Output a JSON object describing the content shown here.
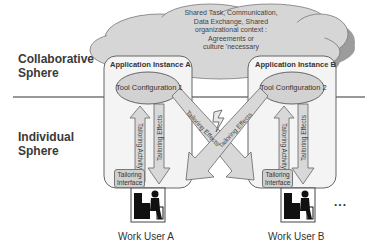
{
  "spheres": {
    "collaborative": {
      "line1": "Collaborative",
      "line2": "Sphere"
    },
    "individual": {
      "line1": "Individual",
      "line2": "Sphere"
    }
  },
  "cloud": {
    "lines": [
      "Shared Task, Communication,",
      "Data Exchange, Shared",
      "organizational context :",
      "Agreements or",
      "culture 'necessary"
    ]
  },
  "instances": [
    {
      "title": "Application Instance A",
      "tool_config": "Tool Configuration 1",
      "activity_label": "Tailoring Activity",
      "effects_label": "Tailoring Effects",
      "interface": {
        "line1": "Tailoring",
        "line2": "Interface"
      },
      "user": "Work User A"
    },
    {
      "title": "Application Instance B",
      "tool_config": "Tool Configuration 2",
      "activity_label": "Tailoring Activity",
      "effects_label": "Tailoring Effects",
      "interface": {
        "line1": "Tailoring",
        "line2": "Interface"
      },
      "user": "Work User B"
    }
  ],
  "cross_arrows": {
    "a_to_b": "Tailoring Effects",
    "b_to_a": "Tailoring Effects"
  },
  "ellipsis": "...",
  "icons": {
    "conflict": "lightning-icon",
    "user": "computer-user-icon"
  },
  "colors": {
    "cloud": "#d4d4d4",
    "cloud_shadow": "#9a9a9a",
    "box_fill": "#f4f4f4",
    "arrow_fill": "#d8d8d8",
    "ellipse_fill": "#d2d2d2",
    "stroke": "#666666"
  }
}
